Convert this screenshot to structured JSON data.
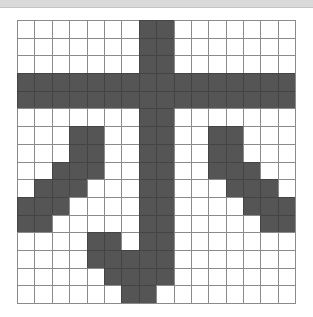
{
  "header": {
    "text": ""
  },
  "grid": {
    "rows": 16,
    "cols": 16,
    "fill_color": "#555555",
    "empty_color": "#ffffff",
    "line_color": "#8a8a8a",
    "pattern": [
      "0000000110000000",
      "0000000110000000",
      "0000000110000000",
      "1111111111111111",
      "1111111111111111",
      "0000000110000000",
      "0001100110011000",
      "0001100110011000",
      "0011100110011100",
      "0111000110001110",
      "1110000110000111",
      "1100000110000011",
      "0000110110000000",
      "0000111110000000",
      "0000011110000000",
      "0000001100000000"
    ]
  }
}
